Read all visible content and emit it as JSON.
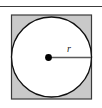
{
  "figure": {
    "name": "circle-inscribed-in-square",
    "rule": {
      "name": "top-rule",
      "color": "#3c3c3c"
    },
    "square": {
      "label": "",
      "fill": "#c9c9c9",
      "stroke": "#3a3a3a",
      "x": 11,
      "y": 14.5,
      "width": 81,
      "height": 85
    },
    "circle": {
      "label": "",
      "fill": "#ffffff",
      "stroke": "#101010",
      "cx": 51.5,
      "cy": 57,
      "r": 40.5
    },
    "center_point": {
      "label": "",
      "fill": "#000000",
      "cx": 48.5,
      "cy": 57.5,
      "r": 3.2
    },
    "radius_segment": {
      "stroke": "#4a4a4a",
      "x1": 48.5,
      "y1": 57.5,
      "x2": 91,
      "y2": 57.5
    },
    "radius_label": {
      "text": "r",
      "x": 70,
      "y": 51,
      "color": "#1a1a1a"
    }
  }
}
